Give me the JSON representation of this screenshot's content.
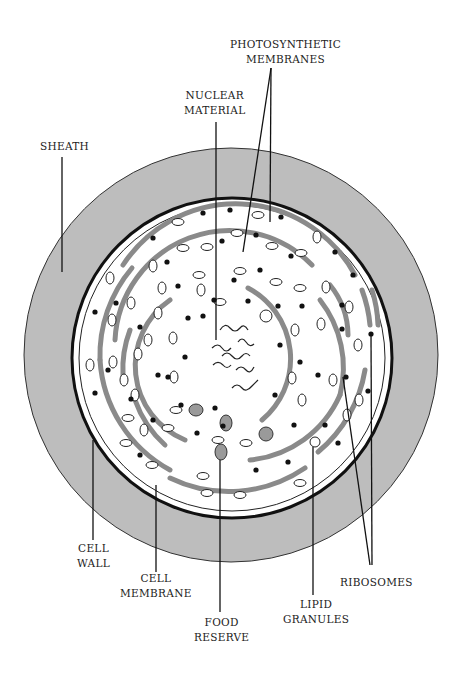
{
  "diagram": {
    "labels": {
      "photosynthetic_membranes": [
        "PHOTOSYNTHETIC",
        "MEMBRANES"
      ],
      "nuclear_material": [
        "NUCLEAR",
        "MATERIAL"
      ],
      "sheath": [
        "SHEATH"
      ],
      "cell_wall": [
        "CELL",
        "WALL"
      ],
      "cell_membrane": [
        "CELL",
        "MEMBRANE"
      ],
      "food_reserve": [
        "FOOD",
        "RESERVE"
      ],
      "lipid_granules": [
        "LIPID",
        "GRANULES"
      ],
      "ribosomes": [
        "RIBOSOMES"
      ]
    },
    "colors": {
      "sheath_fill": "#bdbdbd",
      "membrane_stroke": "#8a8a8a",
      "line": "#111111",
      "cell_fill": "#ffffff"
    }
  }
}
